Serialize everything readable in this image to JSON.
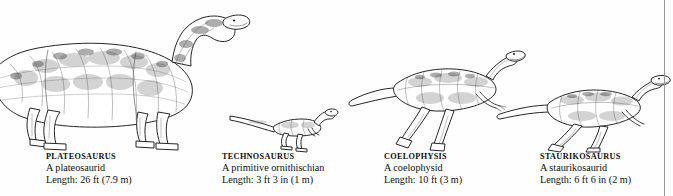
{
  "plate": {
    "background_color": "#fefefe",
    "ink_color": "#2b2b2b",
    "gutter_rule_color": "#9a9a9a"
  },
  "figures": [
    {
      "id": "plateosaurus",
      "name": "PLATEOSAURUS",
      "classification": "A plateosaurid",
      "length": "Length: 26 ft (7.9 m)",
      "length_ft": 26,
      "length_m": 7.9,
      "posture": "quadrupedal-browsing",
      "caption_x": 46,
      "caption_y": 152
    },
    {
      "id": "technosaurus",
      "name": "TECHNOSAURUS",
      "classification": "A primitive ornithischian",
      "length": "Length: 3 ft 3 in (1 m)",
      "length_ft": 3.25,
      "length_m": 1,
      "posture": "bipedal-running",
      "caption_x": 222,
      "caption_y": 152
    },
    {
      "id": "coelophysis",
      "name": "COELOPHYSIS",
      "classification": "A coelophysid",
      "length": "Length: 10 ft (3 m)",
      "length_ft": 10,
      "length_m": 3,
      "posture": "bipedal-striding",
      "caption_x": 384,
      "caption_y": 152
    },
    {
      "id": "staurikosaurus",
      "name": "STAURIKOSAURUS",
      "classification": "A staurikosaurid",
      "length": "Length: 6 ft 6 in (2 m)",
      "length_ft": 6.5,
      "length_m": 2,
      "posture": "bipedal-striding",
      "caption_x": 540,
      "caption_y": 152
    }
  ]
}
